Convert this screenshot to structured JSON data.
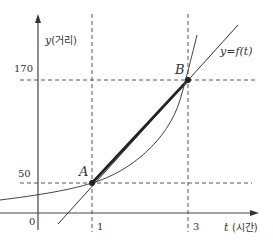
{
  "diagram": {
    "type": "function-graph-average-rate-of-change",
    "x_axis": {
      "variable": "t",
      "label_suffix": "(시간)"
    },
    "y_axis": {
      "variable": "y",
      "label_suffix": "(거리)"
    },
    "origin_label": "0",
    "x_ticks": [
      "1",
      "3"
    ],
    "y_ticks": [
      "50",
      "170"
    ],
    "curve_label": "y=f(t)",
    "points": [
      {
        "name": "A",
        "t": 1,
        "y": 50
      },
      {
        "name": "B",
        "t": 3,
        "y": 170
      }
    ],
    "secant": "AB",
    "colors": {
      "stroke": "#333333",
      "dash": "#555555"
    }
  }
}
